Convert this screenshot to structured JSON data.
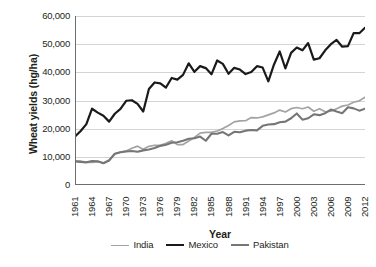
{
  "chart_data": {
    "type": "line",
    "title": "",
    "xlabel": "Year",
    "ylabel": "Wheat yields (hg/ha)",
    "xlim": [
      1961,
      2012
    ],
    "ylim": [
      0,
      60000
    ],
    "ytick_labels": [
      "60,000",
      "50,000",
      "40,000",
      "30,000",
      "20,000",
      "10,000",
      "0"
    ],
    "ytick_values": [
      60000,
      50000,
      40000,
      30000,
      20000,
      10000,
      0
    ],
    "xtick_labels": [
      "1961",
      "1964",
      "1967",
      "1970",
      "1973",
      "1976",
      "1979",
      "1982",
      "1985",
      "1988",
      "1991",
      "1994",
      "1997",
      "2000",
      "2003",
      "2006",
      "2009",
      "2012"
    ],
    "xtick_values": [
      1961,
      1964,
      1967,
      1970,
      1973,
      1976,
      1979,
      1982,
      1985,
      1988,
      1991,
      1994,
      1997,
      2000,
      2003,
      2006,
      2009,
      2012
    ],
    "grid": "horizontal",
    "legend_position": "bottom",
    "x": [
      1961,
      1962,
      1963,
      1964,
      1965,
      1966,
      1967,
      1968,
      1969,
      1970,
      1971,
      1972,
      1973,
      1974,
      1975,
      1976,
      1977,
      1978,
      1979,
      1980,
      1981,
      1982,
      1983,
      1984,
      1985,
      1986,
      1987,
      1988,
      1989,
      1990,
      1991,
      1992,
      1993,
      1994,
      1995,
      1996,
      1997,
      1998,
      1999,
      2000,
      2001,
      2002,
      2003,
      2004,
      2005,
      2006,
      2007,
      2008,
      2009,
      2010,
      2011,
      2012
    ],
    "series": [
      {
        "name": "India",
        "color": "#a3a3a3",
        "width": 1.7,
        "values": [
          8510,
          8470,
          8010,
          8060,
          8270,
          7850,
          8870,
          11030,
          11690,
          12090,
          13070,
          13800,
          12710,
          13720,
          14100,
          14100,
          14800,
          15680,
          14360,
          14360,
          15620,
          16880,
          18430,
          18700,
          18700,
          19160,
          20020,
          21100,
          22400,
          22740,
          22810,
          23940,
          23800,
          24200,
          24900,
          25600,
          26600,
          25900,
          27100,
          27500,
          27080,
          27700,
          26200,
          27100,
          26000,
          26190,
          27080,
          28000,
          28390,
          29380,
          29890,
          31170
        ]
      },
      {
        "name": "Mexico",
        "color": "#1a1a1a",
        "width": 2.2,
        "values": [
          17250,
          19200,
          21600,
          27080,
          25700,
          24600,
          22500,
          25300,
          27000,
          29900,
          30100,
          28800,
          26100,
          34100,
          36400,
          36100,
          34600,
          38000,
          37400,
          39100,
          43200,
          40200,
          42200,
          41500,
          39300,
          44200,
          43000,
          39500,
          41600,
          41000,
          39400,
          40100,
          42200,
          41700,
          36800,
          42800,
          47400,
          41400,
          46900,
          48800,
          47800,
          50400,
          44500,
          45000,
          47800,
          50000,
          51500,
          49100,
          49300,
          53900,
          53900,
          55800
        ]
      },
      {
        "name": "Pakistan",
        "color": "#767676",
        "width": 2.1,
        "values": [
          8400,
          8200,
          8050,
          8500,
          8400,
          7700,
          8700,
          11100,
          11600,
          11900,
          12100,
          11800,
          12300,
          12600,
          13100,
          13900,
          14300,
          15000,
          15200,
          15700,
          16400,
          16600,
          17200,
          15700,
          18200,
          18200,
          18800,
          17600,
          18900,
          18700,
          19300,
          19500,
          19400,
          21000,
          21500,
          21600,
          22300,
          22500,
          23700,
          25400,
          23200,
          23700,
          25100,
          24800,
          25500,
          26800,
          26100,
          25500,
          27600,
          27200,
          26400,
          27100
        ]
      }
    ]
  }
}
